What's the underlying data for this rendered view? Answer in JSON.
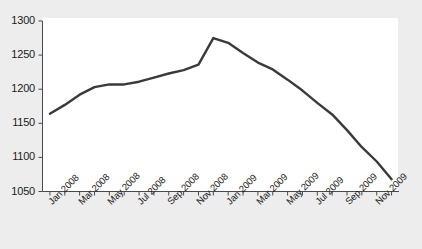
{
  "chart_data": {
    "type": "line",
    "title": "",
    "subtitle": "",
    "xlabel": "",
    "ylabel": "",
    "ylim": [
      1050,
      1300
    ],
    "xlim": [
      "Jan 2008",
      "Dec 2009"
    ],
    "ytick_labels": [
      "1300",
      "1250",
      "1200",
      "1150",
      "1100",
      "1050"
    ],
    "ytick_values": [
      1300,
      1250,
      1200,
      1150,
      1100,
      1050
    ],
    "ytick_step": 50,
    "xtick_labels": [
      "Jan 2008",
      "Mar 2008",
      "May 2008",
      "Jul 2008",
      "Sep 2008",
      "Nov 2008",
      "Jan 2009",
      "Mar 2009",
      "May 2009",
      "Jul 2009",
      "Sep 2009",
      "Nov 2009"
    ],
    "xtick_label_interval_months": 2,
    "minor_tick_interval_months": 1,
    "grid": false,
    "legend": false,
    "legend_position": "none",
    "annotations": [],
    "series": [
      {
        "name": "Index",
        "color": "#3a3a3a",
        "line_width": 2.4,
        "markers": false,
        "x": [
          "Jan 2008",
          "Feb 2008",
          "Mar 2008",
          "Apr 2008",
          "May 2008",
          "Jun 2008",
          "Jul 2008",
          "Aug 2008",
          "Sep 2008",
          "Oct 2008",
          "Nov 2008",
          "Dec 2008",
          "Jan 2009",
          "Feb 2009",
          "Mar 2009",
          "Apr 2009",
          "May 2009",
          "Jun 2009",
          "Jul 2009",
          "Aug 2009",
          "Sep 2009",
          "Oct 2009",
          "Nov 2009",
          "Dec 2009"
        ],
        "values": [
          1164,
          1177,
          1192,
          1203,
          1207,
          1207,
          1211,
          1217,
          1223,
          1228,
          1236,
          1275,
          1268,
          1253,
          1239,
          1229,
          1214,
          1198,
          1180,
          1163,
          1140,
          1115,
          1094,
          1068
        ]
      }
    ]
  },
  "axes": {
    "y_axis_name": "value-axis",
    "x_axis_name": "time-axis"
  }
}
